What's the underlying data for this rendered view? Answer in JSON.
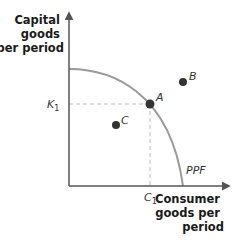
{
  "diagram": {
    "y_axis": {
      "label_lines": [
        "Capital",
        "goods",
        "per period"
      ]
    },
    "x_axis": {
      "label_lines": [
        "Consumer",
        "goods per",
        "period"
      ]
    },
    "curve": {
      "label": "PPF",
      "color": "#9a9a9a"
    },
    "ticks": {
      "y": {
        "base": "K",
        "sub": "1"
      },
      "x": {
        "base": "C",
        "sub": "1"
      }
    },
    "points": [
      {
        "label": "A",
        "description": "on the frontier",
        "color": "#333333"
      },
      {
        "label": "B",
        "description": "outside the frontier (unattainable)",
        "color": "#333333"
      },
      {
        "label": "C",
        "description": "inside the frontier (inefficient)",
        "color": "#333333"
      }
    ],
    "colors": {
      "axis": "#555555",
      "dashed": "#bbbbbb",
      "point": "#333333"
    }
  }
}
